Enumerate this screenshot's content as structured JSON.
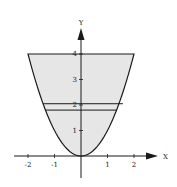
{
  "chart_data": {
    "type": "area",
    "title": "",
    "xlabel": "X",
    "ylabel": "Y",
    "function": "y = x^2",
    "region": {
      "description": "area between parabola y = x^2 and horizontal line y = 4",
      "y_range": [
        0,
        4
      ],
      "x_range": [
        -2,
        2
      ]
    },
    "horizontal_strip": {
      "y_lower": 1.8,
      "y_upper": 2.05,
      "description": "thin horizontal slice near y = 2"
    },
    "x_ticks": [
      -2,
      -1,
      1,
      2
    ],
    "x_tick_labels": [
      "-2",
      "-1",
      "1",
      "2"
    ],
    "y_ticks": [
      1,
      2,
      3,
      4
    ],
    "y_tick_labels": [
      "1",
      "2",
      "3",
      "4"
    ],
    "xlim": [
      -2.6,
      2.8
    ],
    "ylim": [
      -0.8,
      5.6
    ],
    "grid": false,
    "legend": null,
    "colors": {
      "fill": "#e6e6e6",
      "stroke": "#1a1a1a"
    }
  }
}
